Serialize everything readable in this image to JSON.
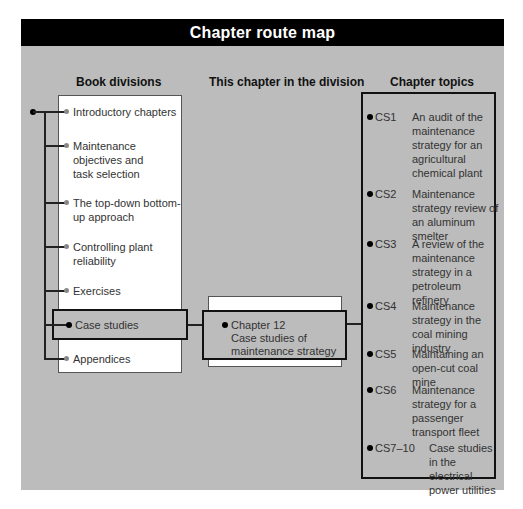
{
  "title": "Chapter route map",
  "colors": {
    "panel_bg": "#bcbcbc",
    "title_bg": "#000000",
    "title_fg": "#ffffff"
  },
  "headers": {
    "book_divisions": "Book divisions",
    "this_chapter": "This chapter in the division",
    "chapter_topics": "Chapter topics"
  },
  "book_divisions": [
    {
      "label": "Introductory chapters",
      "active": false
    },
    {
      "label": "Maintenance objectives and task selection",
      "active": false
    },
    {
      "label": "The top-down bottom-up approach",
      "active": false
    },
    {
      "label": "Controlling plant reliability",
      "active": false
    },
    {
      "label": "Exercises",
      "active": false
    },
    {
      "label": "Case studies",
      "active": true
    },
    {
      "label": "Appendices",
      "active": false
    }
  ],
  "this_chapter": {
    "number": "Chapter 12",
    "title_line1": "Case studies of",
    "title_line2": "maintenance strategy"
  },
  "chapter_topics": [
    {
      "code": "CS1",
      "description": "An audit of the maintenance strategy for an agricultural chemical plant"
    },
    {
      "code": "CS2",
      "description": "Maintenance strategy review of an aluminum smelter"
    },
    {
      "code": "CS3",
      "description": "A review of the maintenance strategy in a petroleum refinery"
    },
    {
      "code": "CS4",
      "description": "Maintenance strategy in the coal mining industry"
    },
    {
      "code": "CS5",
      "description": "Maintaining an open-cut coal mine"
    },
    {
      "code": "CS6",
      "description": "Maintenance strategy for a passenger transport fleet"
    },
    {
      "code": "CS7–10",
      "description": "Case studies in the electrical power utilities"
    }
  ]
}
